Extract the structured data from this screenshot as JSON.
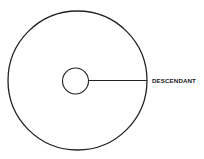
{
  "diagram": {
    "type": "concentric-circle-diagram",
    "outer_circle": {
      "cx": 77.5,
      "cy": 80.5,
      "r": 69.5
    },
    "inner_circle": {
      "cx": 75.5,
      "cy": 81,
      "r": 13
    },
    "connector_line": {
      "x1": 88.5,
      "y1": 80.5,
      "x2": 147,
      "y2": 80.5
    },
    "label": {
      "text": "DESCENDANT",
      "x": 152,
      "y": 82.5
    },
    "stroke_color": "#222222",
    "background_color": "#ffffff"
  }
}
